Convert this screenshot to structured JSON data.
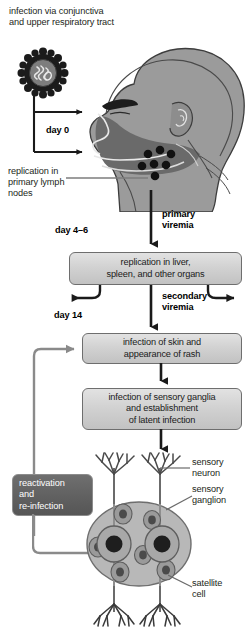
{
  "figure": {
    "title": "infection via conjunctiva\nand upper respiratory tract",
    "virus_icon_name": "virus-particle-icon",
    "head_icon_name": "human-head-sagittal-illustration"
  },
  "labels": {
    "day0": "day 0",
    "day4_6": "day 4–6",
    "day14": "day 14",
    "lymph_nodes": "replication in\nprimary lymph\nnodes",
    "primary_viremia": "primary\nviremia",
    "secondary_viremia": "secondary\nviremia",
    "sensory_neuron": "sensory\nneuron",
    "sensory_ganglion": "sensory\nganglion",
    "satellite_cell": "satellite\ncell"
  },
  "boxes": {
    "organs": "replication in liver,\nspleen, and other organs",
    "skin": "infection of skin and\nappearance of rash",
    "ganglia": "infection of sensory ganglia\nand establishment\nof latent infection",
    "reactivation": "reactivation\nand\nre-infection"
  },
  "colors": {
    "text": "#231f20",
    "box_border": "#6e6e6e",
    "box_fill_top": "#e2e2e2",
    "box_fill_bottom": "#c2c2c2",
    "dark_box_fill": "#5f5f5f",
    "arrow_black": "#1a1a1a",
    "arrow_gray": "#8a8a8a",
    "head_fill": "#9b9b9b",
    "head_dark": "#6a6a6a",
    "ganglion_fill": "#b8b8b8",
    "neuron_fill": "#8f8f8f"
  }
}
